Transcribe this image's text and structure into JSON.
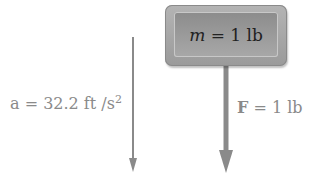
{
  "mass_box": {
    "symbol": "m",
    "equals": " = ",
    "value": "1 lb"
  },
  "acceleration": {
    "symbol": "a",
    "text": " = 32.2 ft /s",
    "exponent": "2"
  },
  "force": {
    "symbol": "F",
    "text": " = 1 lb"
  },
  "colors": {
    "arrow": "#8a8a8a",
    "box_outer": "#a8a8a8",
    "box_inner": "#9a9a9a",
    "label": "#8a8a8a"
  }
}
